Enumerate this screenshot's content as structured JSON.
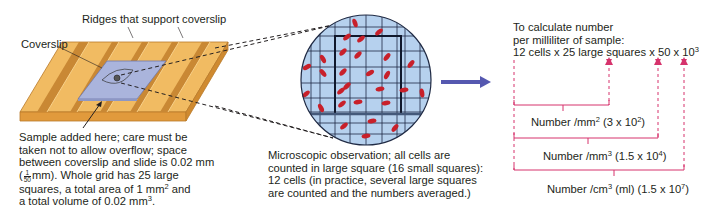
{
  "slide": {
    "ridges_label": "Ridges that support coverslip",
    "coverslip_label": "Coverslip",
    "sample_caption": {
      "line1": "Sample added here; care must be",
      "line2": "taken not to allow overflow; space",
      "line3": "between coverslip and slide is 0.02 mm",
      "line4_frac_num": "1",
      "line4_frac_den": "50",
      "line4_rest": "mm).  Whole grid has 25 large",
      "line4_open": "(",
      "line5_a": "squares, a total area of 1 mm",
      "line5_sup": "2",
      "line5_b": " and",
      "line6_a": "a total volume of 0.02 mm",
      "line6_sup": "3",
      "line6_b": "."
    },
    "colors": {
      "wood": "#e8a84a",
      "wood_dark": "#b97a2a",
      "coverslip": "#aab4dc"
    }
  },
  "microscope": {
    "caption": {
      "line1": "Microscopic observation; all cells are",
      "line2": "counted in large square (16 small squares):",
      "line3": "12 cells (in practice, several large squares",
      "line4": "are counted and the numbers averaged.)"
    },
    "colors": {
      "field": "#b6d1ee",
      "grid": "#1f2a44",
      "cell": "#c8202a"
    }
  },
  "arrow": {
    "icon": "right-arrow-icon",
    "color": "#5558b0"
  },
  "calculation": {
    "title_line1": "To calculate number",
    "title_line2": "per milliliter of sample:",
    "formula": {
      "cells": "12 cells",
      "x1": "x",
      "squares": "25 large squares",
      "x2": "x",
      "depth": "50",
      "x3": "x",
      "conv_base": "10",
      "conv_exp": "3"
    },
    "results": [
      {
        "label_a": "Number /mm",
        "unit_exp": "2",
        "label_b": " (3 x 10",
        "value_exp": "2",
        "label_c": ")"
      },
      {
        "label_a": "Number /mm",
        "unit_exp": "3",
        "label_b": " (1.5 x 10",
        "value_exp": "4",
        "label_c": ")"
      },
      {
        "label_a": "Number /cm",
        "unit_exp": "3",
        "label_b": " (ml) (1.5 x 10",
        "value_exp": "7",
        "label_c": ")"
      }
    ],
    "colors": {
      "bracket": "#d6336c"
    }
  }
}
